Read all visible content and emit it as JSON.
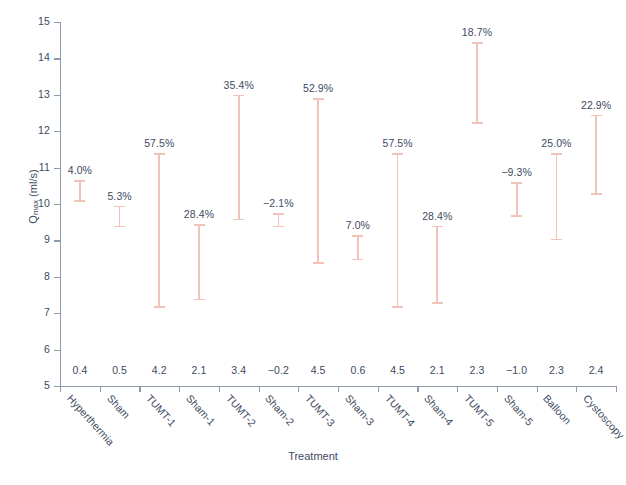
{
  "chart_data": {
    "type": "bar",
    "title": "",
    "xlabel": "Treatment",
    "ylabel": "Qmax (ml/s)",
    "ylabel_base": "Q",
    "ylabel_sub": "max",
    "ylabel_unit": " (ml/s)",
    "ylim": [
      5,
      15
    ],
    "yticks": [
      5,
      6,
      7,
      8,
      9,
      10,
      11,
      12,
      13,
      14,
      15
    ],
    "ytick_labels": [
      "5",
      "6",
      "7",
      "8",
      "9",
      "10",
      "11",
      "12",
      "13",
      "14",
      "15"
    ],
    "grid": false,
    "legend": "none",
    "series_note": "Vertical line ranges with end caps; percent label above each range; baseline change value printed near axis.",
    "categories": [
      "Hyperthermia",
      "Sham",
      "TUMT-1",
      "Sham-1",
      "TUMT-2",
      "Sham-2",
      "TUMT-3",
      "Sham-3",
      "TUMT-4",
      "Sham-4",
      "TUMT-5",
      "Sham-5",
      "Balloon",
      "Cystoscopy"
    ],
    "percent_labels": [
      "4.0%",
      "5.3%",
      "57.5%",
      "28.4%",
      "35.4%",
      "−2.1%",
      "52.9%",
      "7.0%",
      "57.5%",
      "28.4%",
      "18.7%",
      "−9.3%",
      "25.0%",
      "22.9%"
    ],
    "percent_values": [
      4.0,
      5.3,
      57.5,
      28.4,
      35.4,
      -2.1,
      52.9,
      7.0,
      57.5,
      28.4,
      18.7,
      -9.3,
      25.0,
      22.9
    ],
    "baseline_labels": [
      "0.4",
      "0.5",
      "4.2",
      "2.1",
      "3.4",
      "−0.2",
      "4.5",
      "0.6",
      "4.5",
      "2.1",
      "2.3",
      "−1.0",
      "2.3",
      "2.4"
    ],
    "baseline_values": [
      0.4,
      0.5,
      4.2,
      2.1,
      3.4,
      -0.2,
      4.5,
      0.6,
      4.5,
      2.1,
      2.3,
      -1.0,
      2.3,
      2.4
    ],
    "interval_low": [
      10.1,
      9.4,
      7.2,
      7.4,
      9.6,
      9.4,
      8.4,
      8.5,
      7.2,
      7.3,
      12.25,
      9.7,
      9.05,
      10.3
    ],
    "interval_high": [
      10.65,
      9.95,
      11.4,
      9.45,
      13.0,
      9.75,
      12.9,
      9.15,
      11.4,
      9.4,
      14.45,
      10.6,
      11.4,
      12.45
    ],
    "colors": {
      "bar": "#f2c3b9",
      "text": "#3d4a63",
      "axis": "#8d99ad",
      "background": "#ffffff"
    }
  },
  "bottom_caption": ""
}
